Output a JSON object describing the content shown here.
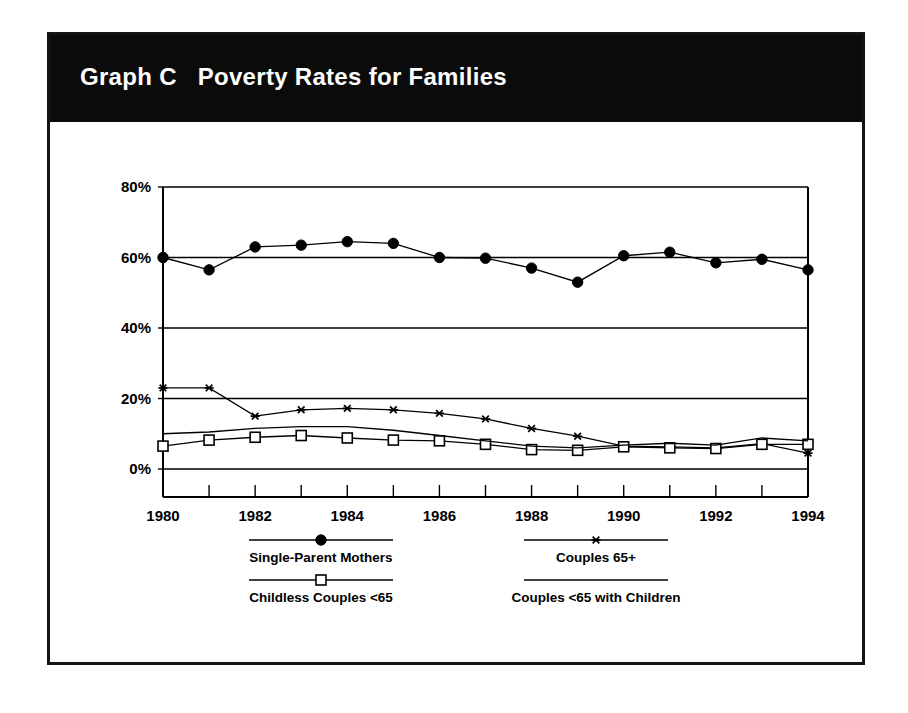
{
  "figure": {
    "label": "Graph C",
    "title": "Poverty Rates for Families",
    "title_full": "Graph C   Poverty Rates for Families",
    "banner_color": "#0b0b0b",
    "banner_text_color": "#ffffff",
    "frame_color": "#141414",
    "background_color": "#ffffff"
  },
  "chart_data": {
    "type": "line",
    "title": "Poverty Rates for Families",
    "xlabel": "",
    "ylabel": "",
    "x": [
      1980,
      1981,
      1982,
      1983,
      1984,
      1985,
      1986,
      1987,
      1988,
      1989,
      1990,
      1991,
      1992,
      1993,
      1994
    ],
    "xtick_labels": [
      "1980",
      "",
      "1982",
      "",
      "1984",
      "",
      "1986",
      "",
      "1988",
      "",
      "1990",
      "",
      "1992",
      "",
      "1994"
    ],
    "xtick_labels_shown": [
      "1980",
      "1982",
      "1984",
      "1986",
      "1988",
      "1990",
      "1992",
      "1994"
    ],
    "ytick_labels": [
      "0%",
      "20%",
      "40%",
      "60%",
      "80%"
    ],
    "yticks": [
      0,
      20,
      40,
      60,
      80
    ],
    "xlim": [
      1980,
      1994
    ],
    "ylim": [
      0,
      80
    ],
    "grid": "horizontal",
    "legend_position": "below-axes",
    "series": [
      {
        "name": "Single-Parent Mothers",
        "marker": "filled-circle",
        "values": [
          60.0,
          56.5,
          63.0,
          63.5,
          64.5,
          64.0,
          60.0,
          59.8,
          57.0,
          53.0,
          60.5,
          61.5,
          58.5,
          59.5,
          56.5
        ]
      },
      {
        "name": "Couples 65+",
        "marker": "asterisk",
        "values": [
          23.0,
          23.0,
          15.0,
          16.8,
          17.2,
          16.8,
          15.8,
          14.2,
          11.5,
          9.3,
          6.5,
          6.3,
          6.0,
          7.2,
          4.5
        ]
      },
      {
        "name": "Childless Couples <65",
        "marker": "open-square",
        "values": [
          6.5,
          8.2,
          9.0,
          9.5,
          8.8,
          8.2,
          8.0,
          7.0,
          5.5,
          5.3,
          6.3,
          6.0,
          5.8,
          7.0,
          7.0
        ]
      },
      {
        "name": "Couples <65 with Children",
        "marker": "none",
        "values": [
          10.0,
          10.5,
          11.5,
          12.0,
          12.0,
          11.0,
          9.5,
          8.0,
          6.5,
          6.0,
          6.8,
          7.3,
          6.8,
          8.8,
          8.0
        ]
      }
    ]
  },
  "legend": {
    "entries": [
      {
        "label": "Single-Parent Mothers",
        "marker": "filled-circle"
      },
      {
        "label": "Couples 65+",
        "marker": "asterisk"
      },
      {
        "label": "Childless Couples <65",
        "marker": "open-square"
      },
      {
        "label": "Couples <65 with Children",
        "marker": "none"
      }
    ]
  }
}
